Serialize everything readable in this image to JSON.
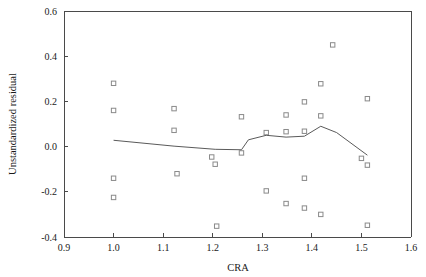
{
  "chart_data": {
    "type": "scatter",
    "title": "",
    "xlabel": "CRA",
    "ylabel": "Unstandardized residual",
    "xlim": [
      0.9,
      1.6
    ],
    "ylim": [
      -0.4,
      0.6
    ],
    "xticks": [
      0.9,
      1.0,
      1.1,
      1.2,
      1.3,
      1.4,
      1.5,
      1.6
    ],
    "xtick_labels": [
      "0.9",
      "1.0",
      "1.1",
      "1.2",
      "1.3",
      "1.4",
      "1.5",
      "1.6"
    ],
    "yticks": [
      -0.4,
      -0.2,
      0.0,
      0.2,
      0.4,
      0.6
    ],
    "ytick_labels": [
      "-0.4",
      "-0.2",
      "0.0",
      "0.2",
      "0.4",
      "0.6"
    ],
    "grid": false,
    "legend": null,
    "marker": "open-square",
    "points": [
      {
        "x": 1.0,
        "y": 0.28
      },
      {
        "x": 1.0,
        "y": 0.16
      },
      {
        "x": 1.0,
        "y": -0.14
      },
      {
        "x": 1.0,
        "y": -0.225
      },
      {
        "x": 1.122,
        "y": 0.168
      },
      {
        "x": 1.122,
        "y": 0.072
      },
      {
        "x": 1.128,
        "y": -0.12
      },
      {
        "x": 1.198,
        "y": -0.046
      },
      {
        "x": 1.205,
        "y": -0.078
      },
      {
        "x": 1.208,
        "y": -0.352
      },
      {
        "x": 1.258,
        "y": 0.132
      },
      {
        "x": 1.258,
        "y": -0.028
      },
      {
        "x": 1.308,
        "y": 0.062
      },
      {
        "x": 1.308,
        "y": -0.196
      },
      {
        "x": 1.348,
        "y": 0.14
      },
      {
        "x": 1.348,
        "y": 0.066
      },
      {
        "x": 1.348,
        "y": -0.252
      },
      {
        "x": 1.385,
        "y": 0.198
      },
      {
        "x": 1.385,
        "y": 0.068
      },
      {
        "x": 1.385,
        "y": -0.14
      },
      {
        "x": 1.385,
        "y": -0.272
      },
      {
        "x": 1.418,
        "y": 0.278
      },
      {
        "x": 1.418,
        "y": 0.136
      },
      {
        "x": 1.418,
        "y": -0.3
      },
      {
        "x": 1.442,
        "y": 0.45
      },
      {
        "x": 1.5,
        "y": -0.052
      },
      {
        "x": 1.512,
        "y": 0.212
      },
      {
        "x": 1.512,
        "y": -0.082
      },
      {
        "x": 1.512,
        "y": -0.348
      }
    ],
    "trend_line": [
      {
        "x": 1.0,
        "y": 0.028
      },
      {
        "x": 1.122,
        "y": 0.002
      },
      {
        "x": 1.205,
        "y": -0.012
      },
      {
        "x": 1.258,
        "y": -0.014
      },
      {
        "x": 1.272,
        "y": 0.03
      },
      {
        "x": 1.308,
        "y": 0.05
      },
      {
        "x": 1.348,
        "y": 0.042
      },
      {
        "x": 1.385,
        "y": 0.046
      },
      {
        "x": 1.418,
        "y": 0.09
      },
      {
        "x": 1.45,
        "y": 0.062
      },
      {
        "x": 1.512,
        "y": -0.038
      }
    ]
  },
  "style": {
    "axis_color": "#4a4a4a",
    "marker_color": "#8a8a8a",
    "line_color": "#5a5a5a",
    "text_color": "#1a1a1a",
    "background": "#ffffff"
  }
}
